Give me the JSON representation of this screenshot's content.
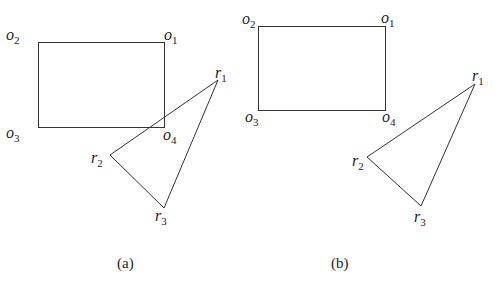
{
  "colors": {
    "stroke": "#333333",
    "text": "#222222",
    "background": "#ffffff"
  },
  "panels": [
    {
      "caption": "(a)",
      "rectangle": {
        "corners": [
          {
            "base": "o",
            "sub": "1",
            "x": 164,
            "y": 42
          },
          {
            "base": "o",
            "sub": "2",
            "x": 38,
            "y": 42
          },
          {
            "base": "o",
            "sub": "3",
            "x": 38,
            "y": 127
          },
          {
            "base": "o",
            "sub": "4",
            "x": 164,
            "y": 127
          }
        ]
      },
      "triangle": {
        "vertices": [
          {
            "base": "r",
            "sub": "1",
            "x": 218,
            "y": 80
          },
          {
            "base": "r",
            "sub": "2",
            "x": 110,
            "y": 155
          },
          {
            "base": "r",
            "sub": "3",
            "x": 164,
            "y": 208
          }
        ]
      },
      "note": "triangle overlaps rectangle"
    },
    {
      "caption": "(b)",
      "rectangle": {
        "corners": [
          {
            "base": "o",
            "sub": "1",
            "x": 385,
            "y": 26
          },
          {
            "base": "o",
            "sub": "2",
            "x": 258,
            "y": 26
          },
          {
            "base": "o",
            "sub": "3",
            "x": 258,
            "y": 110
          },
          {
            "base": "o",
            "sub": "4",
            "x": 385,
            "y": 110
          }
        ]
      },
      "triangle": {
        "vertices": [
          {
            "base": "r",
            "sub": "1",
            "x": 475,
            "y": 84
          },
          {
            "base": "r",
            "sub": "2",
            "x": 367,
            "y": 157
          },
          {
            "base": "r",
            "sub": "3",
            "x": 421,
            "y": 206
          }
        ]
      },
      "note": "triangle separated from rectangle"
    }
  ]
}
